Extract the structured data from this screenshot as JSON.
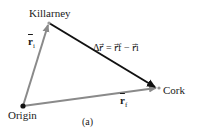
{
  "diagram": {
    "points": {
      "origin": {
        "label": "Origin",
        "x": 23,
        "y": 106
      },
      "killarney": {
        "label": "Killarney",
        "x": 49,
        "y": 23
      },
      "cork": {
        "label": "Cork",
        "x": 158,
        "y": 88
      }
    },
    "vectors": {
      "r_initial": {
        "label": "r⃗i",
        "symbol": "r",
        "subscript": "i",
        "color": "#8a8a8a"
      },
      "r_final": {
        "label": "r⃗f",
        "symbol": "r",
        "subscript": "f",
        "color": "#8a8a8a"
      },
      "displacement": {
        "label": "Δr⃗ = r⃗f − r⃗i",
        "color": "#111111"
      }
    },
    "caption": "(a)"
  }
}
